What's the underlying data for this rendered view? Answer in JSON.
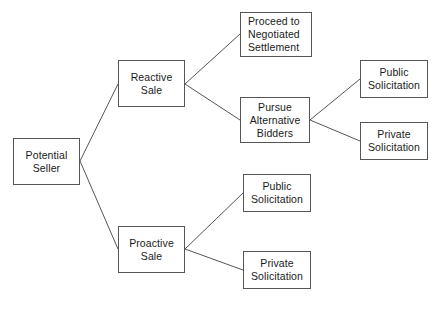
{
  "diagram": {
    "type": "tree-diagram",
    "background_color": "#ffffff",
    "node_border_color": "#555555",
    "node_fill_color": "#ffffff",
    "edge_color": "#555555",
    "text_color": "#1a1a1a"
  },
  "nodes": [
    {
      "id": "potential-seller",
      "name": "potential-seller",
      "lines": [
        "Potential",
        "Seller"
      ],
      "align": "center",
      "x": 13,
      "y": 138,
      "w": 67,
      "h": 47
    },
    {
      "id": "reactive-sale",
      "name": "reactive-sale",
      "lines": [
        "Reactive",
        "Sale"
      ],
      "align": "center",
      "x": 118,
      "y": 60,
      "w": 67,
      "h": 47
    },
    {
      "id": "proactive-sale",
      "name": "proactive-sale",
      "lines": [
        "Proactive",
        "Sale"
      ],
      "align": "center",
      "x": 118,
      "y": 226,
      "w": 67,
      "h": 47
    },
    {
      "id": "proceed-negotiated-settlement",
      "name": "proceed-to-negotiated-settlement",
      "lines": [
        "Proceed to",
        "Negotiated",
        "Settlement"
      ],
      "align": "lead",
      "x": 240,
      "y": 12,
      "w": 72,
      "h": 45
    },
    {
      "id": "pursue-alternative-bidders",
      "name": "pursue-alternative-bidders",
      "lines": [
        "Pursue",
        "Alternative",
        "Bidders"
      ],
      "align": "center",
      "x": 240,
      "y": 97,
      "w": 70,
      "h": 46
    },
    {
      "id": "public-solicitation-top",
      "name": "public-solicitation-reactive",
      "lines": [
        "Public",
        "Solicitation"
      ],
      "align": "center",
      "x": 360,
      "y": 60,
      "w": 68,
      "h": 38
    },
    {
      "id": "private-solicitation-top",
      "name": "private-solicitation-reactive",
      "lines": [
        "Private",
        "Solicitation"
      ],
      "align": "center",
      "x": 360,
      "y": 122,
      "w": 68,
      "h": 38
    },
    {
      "id": "public-solicitation-bottom",
      "name": "public-solicitation-proactive",
      "lines": [
        "Public",
        "Solicitation"
      ],
      "align": "center",
      "x": 243,
      "y": 174,
      "w": 68,
      "h": 38
    },
    {
      "id": "private-solicitation-bottom",
      "name": "private-solicitation-proactive",
      "lines": [
        "Private",
        "Solicitation"
      ],
      "align": "center",
      "x": 243,
      "y": 251,
      "w": 68,
      "h": 38
    }
  ],
  "edges": [
    {
      "name": "edge-potential-seller-to-reactive-sale",
      "from": "potential-seller",
      "to": "reactive-sale",
      "x1": 80,
      "y1": 161,
      "x2": 118,
      "y2": 84
    },
    {
      "name": "edge-potential-seller-to-proactive-sale",
      "from": "potential-seller",
      "to": "proactive-sale",
      "x1": 80,
      "y1": 161,
      "x2": 118,
      "y2": 249
    },
    {
      "name": "edge-reactive-sale-to-proceed",
      "from": "reactive-sale",
      "to": "proceed-negotiated-settlement",
      "x1": 185,
      "y1": 84,
      "x2": 240,
      "y2": 34
    },
    {
      "name": "edge-reactive-sale-to-pursue",
      "from": "reactive-sale",
      "to": "pursue-alternative-bidders",
      "x1": 185,
      "y1": 84,
      "x2": 240,
      "y2": 120
    },
    {
      "name": "edge-pursue-to-public-solicitation",
      "from": "pursue-alternative-bidders",
      "to": "public-solicitation-top",
      "x1": 310,
      "y1": 120,
      "x2": 360,
      "y2": 79
    },
    {
      "name": "edge-pursue-to-private-solicitation",
      "from": "pursue-alternative-bidders",
      "to": "private-solicitation-top",
      "x1": 310,
      "y1": 120,
      "x2": 360,
      "y2": 141
    },
    {
      "name": "edge-proactive-sale-to-public-solicitation",
      "from": "proactive-sale",
      "to": "public-solicitation-bottom",
      "x1": 185,
      "y1": 249,
      "x2": 243,
      "y2": 193
    },
    {
      "name": "edge-proactive-sale-to-private-solicitation",
      "from": "proactive-sale",
      "to": "private-solicitation-bottom",
      "x1": 185,
      "y1": 249,
      "x2": 243,
      "y2": 270
    }
  ]
}
